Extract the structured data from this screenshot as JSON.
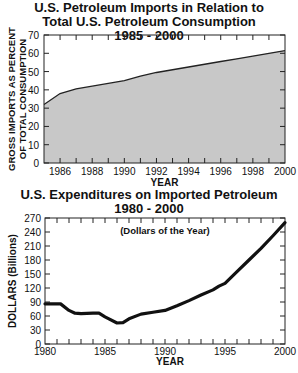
{
  "chart_data": [
    {
      "type": "area",
      "title": "U.S. Petroleum Imports in Relation to Total U.S. Petroleum Consumption 1985 - 2000",
      "title_lines": [
        "U.S. Petroleum Imports in Relation to",
        "Total U.S. Petroleum Consumption",
        "1985 - 2000"
      ],
      "xlabel": "YEAR",
      "ylabel_lines": [
        "GROSS IMPORTS AS PERCENT",
        "OF TOTAL CONSUMPTION"
      ],
      "xlim": [
        1985,
        2000
      ],
      "ylim": [
        0,
        70
      ],
      "x_ticks": [
        "1986",
        "1988",
        "1990",
        "1992",
        "1994",
        "1996",
        "1998",
        "2000"
      ],
      "y_ticks": [
        "0",
        "10",
        "20",
        "30",
        "40",
        "50",
        "60",
        "70"
      ],
      "grid": false,
      "fill_color": "#c8c8c8",
      "x": [
        1985,
        1986,
        1987,
        1988,
        1989,
        1990,
        1991,
        1992,
        1993,
        1994,
        1995,
        1996,
        1997,
        1998,
        1999,
        2000
      ],
      "values": [
        32,
        38,
        40.5,
        42,
        43.5,
        45,
        47.5,
        49.5,
        51,
        52.5,
        54,
        55.5,
        57,
        58.5,
        60,
        61.5
      ]
    },
    {
      "type": "line",
      "title": "U.S. Expenditures on Imported Petroleum 1980 - 2000",
      "title_lines": [
        "U.S. Expenditures on Imported Petroleum",
        "1980 - 2000"
      ],
      "subtitle": "(Dollars of the Year)",
      "xlabel": "YEAR",
      "ylabel": "DOLLARS (Billions)",
      "xlim": [
        1980,
        2000
      ],
      "ylim": [
        0,
        270
      ],
      "x_ticks": [
        "1980",
        "1985",
        "1990",
        "1995",
        "2000"
      ],
      "y_ticks": [
        "0",
        "30",
        "60",
        "90",
        "120",
        "150",
        "180",
        "210",
        "240",
        "270"
      ],
      "grid": false,
      "x": [
        1980,
        1981,
        1981.3,
        1982,
        1982.5,
        1983,
        1984,
        1984.5,
        1985,
        1986,
        1986.5,
        1987,
        1988,
        1989,
        1990,
        1991,
        1992,
        1993,
        1994,
        1994.5,
        1995,
        1996,
        1997,
        1998,
        1999,
        2000
      ],
      "values": [
        86,
        86,
        86,
        72,
        66,
        65,
        66,
        66,
        58,
        45,
        46,
        54,
        64,
        68,
        72,
        82,
        93,
        105,
        116,
        124,
        130,
        155,
        180,
        205,
        232,
        260
      ]
    }
  ]
}
